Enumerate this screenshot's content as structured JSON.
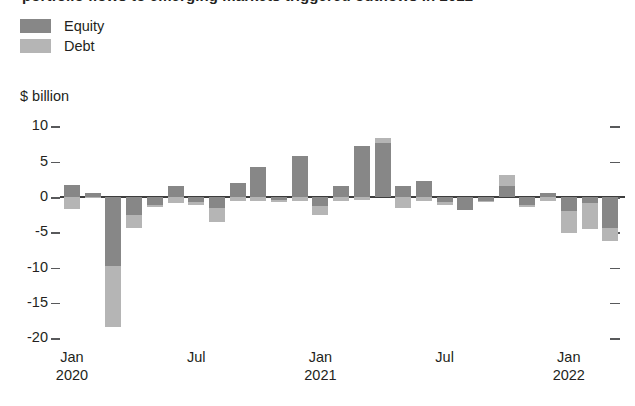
{
  "title": {
    "text": "portfolio flows to emerging markets triggered outflows in 2022",
    "truncated": true
  },
  "legend": {
    "items": [
      {
        "label": "Equity",
        "color": "#878787",
        "key": "equity"
      },
      {
        "label": "Debt",
        "color": "#b5b5b5",
        "key": "debt"
      }
    ]
  },
  "axis": {
    "y_unit": "$ billion",
    "y_ticks": [
      "10",
      "5",
      "0",
      "-5",
      "-10",
      "-15",
      "-20"
    ],
    "x_labels": [
      {
        "month": "Jan",
        "year": "2020"
      },
      {
        "month": "Jul",
        "year": ""
      },
      {
        "month": "Jan",
        "year": "2021"
      },
      {
        "month": "Jul",
        "year": ""
      },
      {
        "month": "Jan",
        "year": "2022"
      }
    ]
  },
  "chart_data": {
    "type": "bar",
    "stacked": true,
    "title": "portfolio flows to emerging markets triggered outflows in 2022",
    "xlabel": "",
    "ylabel": "$ billion",
    "ylim": [
      -21,
      11
    ],
    "yticks": [
      10,
      5,
      0,
      -5,
      -10,
      -15,
      -20
    ],
    "grid": false,
    "legend_position": "top-left",
    "categories": [
      "Jan 2020",
      "Feb 2020",
      "Mar 2020",
      "Apr 2020",
      "May 2020",
      "Jun 2020",
      "Jul 2020",
      "Aug 2020",
      "Sep 2020",
      "Oct 2020",
      "Nov 2020",
      "Dec 2020",
      "Jan 2021",
      "Feb 2021",
      "Mar 2021",
      "Apr 2021",
      "May 2021",
      "Jun 2021",
      "Jul 2021",
      "Aug 2021",
      "Sep 2021",
      "Oct 2021",
      "Nov 2021",
      "Dec 2021",
      "Jan 2022",
      "Feb 2022",
      "Mar 2022"
    ],
    "series": [
      {
        "name": "Equity",
        "color": "#878787",
        "values": [
          1.7,
          0.6,
          -9.8,
          -2.6,
          -1.1,
          1.5,
          -0.7,
          -1.6,
          2.0,
          4.2,
          -0.4,
          5.8,
          -1.3,
          1.5,
          7.2,
          7.7,
          1.6,
          2.3,
          -0.7,
          -1.9,
          -0.5,
          1.5,
          -1.1,
          0.5,
          -2.0,
          -0.9,
          -4.4
        ]
      },
      {
        "name": "Debt",
        "color": "#b5b5b5",
        "values": [
          -1.7,
          -0.2,
          -8.6,
          -1.8,
          -0.3,
          -0.9,
          -0.5,
          -2.0,
          -0.5,
          -0.5,
          -0.3,
          -0.5,
          -1.3,
          -0.5,
          -0.4,
          0.6,
          -1.5,
          -0.6,
          -0.4,
          0.0,
          -0.2,
          1.6,
          -0.3,
          -0.5,
          -3.1,
          -3.6,
          -1.9
        ]
      }
    ]
  }
}
